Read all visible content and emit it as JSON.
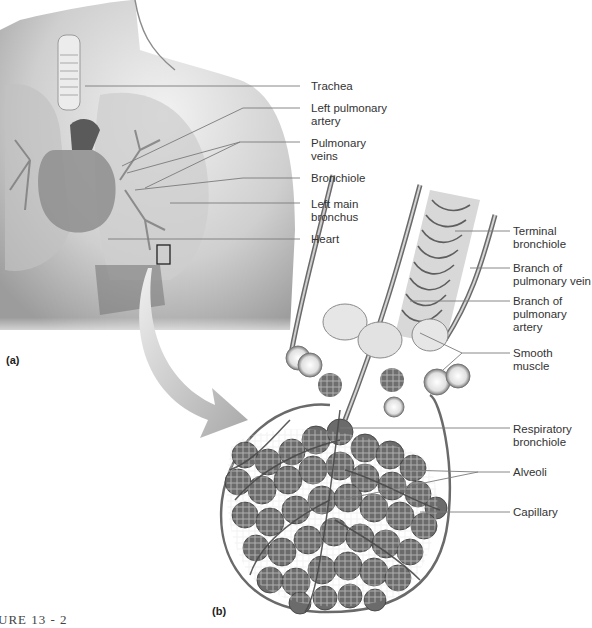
{
  "figure": {
    "panel_a_tag": "(a)",
    "panel_b_tag": "(b)",
    "caption_fragment": "URE 13 - 2"
  },
  "panel_a_labels": [
    {
      "id": "trachea",
      "text": "Trachea"
    },
    {
      "id": "left-pulmonary-artery",
      "text": "Left pulmonary\nartery"
    },
    {
      "id": "pulmonary-veins",
      "text": "Pulmonary\nveins"
    },
    {
      "id": "bronchiole",
      "text": "Bronchiole"
    },
    {
      "id": "left-main-bronchus",
      "text": "Left main\nbronchus"
    },
    {
      "id": "heart",
      "text": "Heart"
    }
  ],
  "panel_b_labels": [
    {
      "id": "terminal-bronchiole",
      "text": "Terminal\nbronchiole"
    },
    {
      "id": "branch-pulmonary-vein",
      "text": "Branch of\npulmonary vein"
    },
    {
      "id": "branch-pulmonary-artery",
      "text": "Branch of\npulmonary artery"
    },
    {
      "id": "smooth-muscle",
      "text": "Smooth muscle"
    },
    {
      "id": "respiratory-bronchiole",
      "text": "Respiratory\nbronchiole"
    },
    {
      "id": "alveoli",
      "text": "Alveoli"
    },
    {
      "id": "capillary",
      "text": "Capillary"
    }
  ],
  "colors": {
    "line": "#6a6a6a",
    "skin_light": "#e6e6e6",
    "skin_dark": "#9a9a9a",
    "alveoli": "#6e6e6e",
    "arrow": "#b5b5b5"
  }
}
